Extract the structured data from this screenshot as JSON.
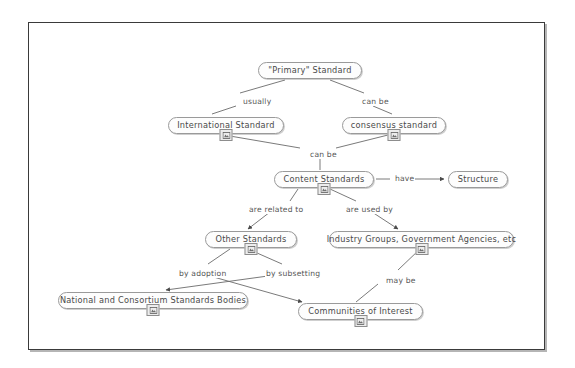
{
  "diagram": {
    "frame": {
      "border_color": "#3a3a3a"
    },
    "node_style": {
      "fill": "#fdfdfd",
      "border": "#9a9a9a",
      "text": "#4a4a4a"
    },
    "edge_style": {
      "line": "#6b6b6b",
      "label_text": "#555555"
    },
    "nodes": [
      {
        "id": "primary",
        "label": "\"Primary\" Standard",
        "x": 258,
        "y": 62,
        "w": 104,
        "badge": false
      },
      {
        "id": "intl",
        "label": "International Standard",
        "x": 168,
        "y": 117,
        "w": 116,
        "badge": true
      },
      {
        "id": "consensus",
        "label": "consensus standard",
        "x": 342,
        "y": 117,
        "w": 104,
        "badge": true
      },
      {
        "id": "content",
        "label": "Content Standards",
        "x": 274,
        "y": 171,
        "w": 100,
        "badge": true
      },
      {
        "id": "structure",
        "label": "Structure",
        "x": 448,
        "y": 171,
        "w": 60,
        "badge": false
      },
      {
        "id": "other",
        "label": "Other Standards",
        "x": 205,
        "y": 231,
        "w": 92,
        "badge": true
      },
      {
        "id": "industry",
        "label": "Industry Groups, Government Agencies, etc",
        "x": 329,
        "y": 231,
        "w": 185,
        "badge": true
      },
      {
        "id": "bodies",
        "label": "National and Consortium Standards Bodies",
        "x": 58,
        "y": 292,
        "w": 190,
        "badge": true
      },
      {
        "id": "comm",
        "label": "Communities of Interest",
        "x": 298,
        "y": 303,
        "w": 125,
        "badge": true
      }
    ],
    "edges": [
      {
        "id": "primary-intl",
        "from": "primary",
        "to": "intl",
        "label": "usually",
        "label_x": 242,
        "label_y": 98,
        "arrow": false
      },
      {
        "id": "primary-consensus",
        "from": "primary",
        "to": "consensus",
        "label": "can be",
        "label_x": 361,
        "label_y": 98,
        "arrow": false
      },
      {
        "id": "intl-content",
        "from": "intl",
        "to": "content",
        "label": "can be",
        "label_x": 309,
        "label_y": 151,
        "arrow": false
      },
      {
        "id": "content-structure",
        "from": "content",
        "to": "structure",
        "label": "have",
        "label_x": 394,
        "label_y": 175,
        "arrow": true
      },
      {
        "id": "content-other",
        "from": "content",
        "to": "other",
        "label": "are related to",
        "label_x": 248,
        "label_y": 206,
        "arrow": true
      },
      {
        "id": "content-industry",
        "from": "content",
        "to": "industry",
        "label": "are used by",
        "label_x": 345,
        "label_y": 206,
        "arrow": true
      },
      {
        "id": "other-comm",
        "from": "other",
        "to": "comm",
        "label": "by adoption",
        "label_x": 178,
        "label_y": 270,
        "arrow": true
      },
      {
        "id": "other-bodies",
        "from": "other",
        "to": "bodies",
        "label": "by subsetting",
        "label_x": 265,
        "label_y": 270,
        "arrow": true
      },
      {
        "id": "comm-industry",
        "from": "comm",
        "to": "industry",
        "label": "may be",
        "label_x": 385,
        "label_y": 277,
        "arrow": true
      }
    ]
  }
}
